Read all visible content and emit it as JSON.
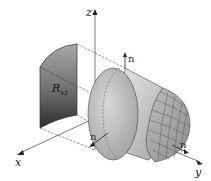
{
  "diagram": {
    "axes": {
      "x_label": "x",
      "y_label": "y",
      "z_label": "z"
    },
    "region": {
      "label_main": "R",
      "label_sub": "xz"
    },
    "normals": [
      {
        "label": "n",
        "position": "top"
      },
      {
        "label": "n",
        "position": "front"
      },
      {
        "label": "n",
        "position": "right"
      }
    ],
    "colors": {
      "region_dark": "#3a3a3a",
      "region_light": "#9a9a9a",
      "cylinder": "#c8c8c8",
      "cap": "#b0b0b0",
      "lines": "#444444"
    }
  }
}
